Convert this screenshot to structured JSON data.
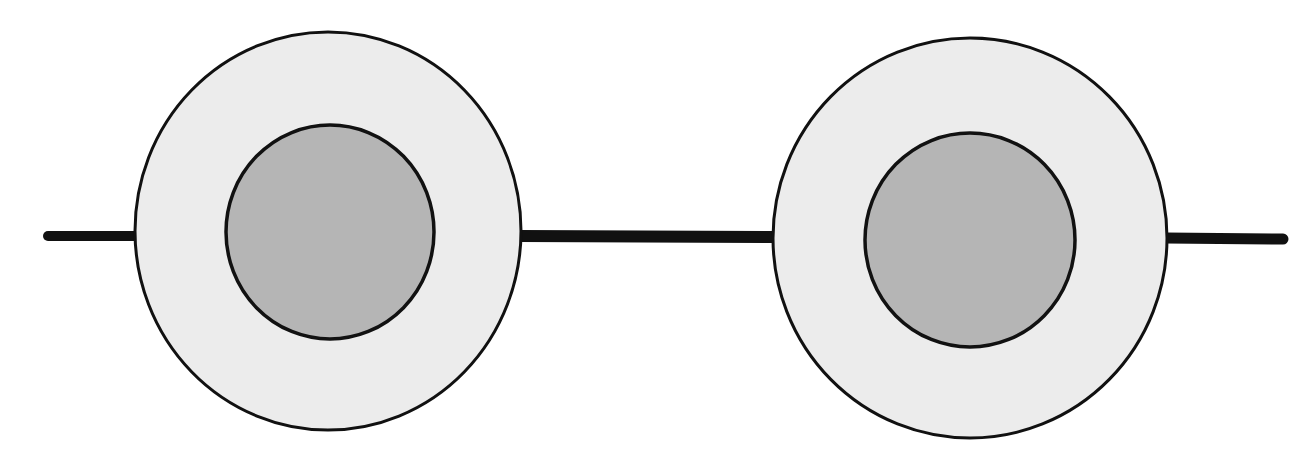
{
  "canvas": {
    "width": 1314,
    "height": 465,
    "background": "#ffffff"
  },
  "colors": {
    "stroke": "#111111",
    "outer_fill": "#ececec",
    "inner_fill": "#b5b5b5"
  },
  "lines": [
    {
      "name": "left-connector-line",
      "x1": 48,
      "y1": 236,
      "x2": 136,
      "y2": 236,
      "width": 10
    },
    {
      "name": "middle-connector-line",
      "x1": 520,
      "y1": 236,
      "x2": 775,
      "y2": 237,
      "width": 12
    },
    {
      "name": "right-connector-line",
      "x1": 1166,
      "y1": 238,
      "x2": 1283,
      "y2": 239,
      "width": 11
    }
  ],
  "nodes": [
    {
      "name": "left-node",
      "outer": {
        "cx": 328,
        "cy": 231,
        "rx": 193,
        "ry": 199,
        "stroke_width": 3
      },
      "inner": {
        "cx": 330,
        "cy": 232,
        "rx": 104,
        "ry": 107,
        "stroke_width": 3.5
      }
    },
    {
      "name": "right-node",
      "outer": {
        "cx": 970,
        "cy": 238,
        "rx": 197,
        "ry": 200,
        "stroke_width": 3
      },
      "inner": {
        "cx": 970,
        "cy": 240,
        "rx": 105,
        "ry": 107,
        "stroke_width": 3.5
      }
    }
  ]
}
